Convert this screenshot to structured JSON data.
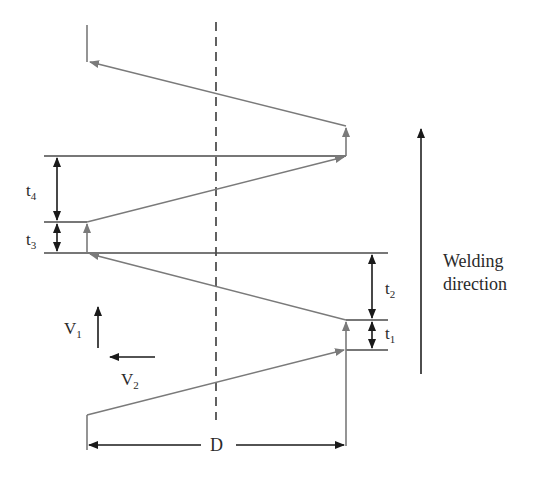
{
  "diagram": {
    "labels": {
      "t1": "t",
      "t1_sub": "1",
      "t2": "t",
      "t2_sub": "2",
      "t3": "t",
      "t3_sub": "3",
      "t4": "t",
      "t4_sub": "4",
      "v1": "V",
      "v1_sub": "1",
      "v2": "V",
      "v2_sub": "2",
      "d": "D",
      "welding_line1": "Welding",
      "welding_line2": "direction"
    },
    "colors": {
      "path": "#7a7a7a",
      "dimension": "#1a1a1a",
      "centerline": "#3a3a3a",
      "text": "#2a2a2a"
    }
  }
}
